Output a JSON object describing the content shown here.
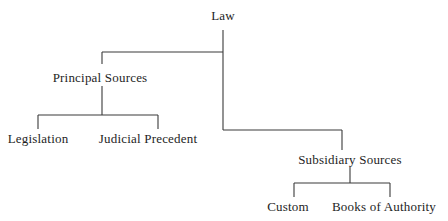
{
  "diagram": {
    "type": "tree",
    "root": {
      "label": "Law",
      "children": [
        {
          "label": "Principal Sources",
          "children": [
            {
              "label": "Legislation"
            },
            {
              "label": "Judicial Precedent"
            }
          ]
        },
        {
          "label": "Subsidiary Sources",
          "children": [
            {
              "label": "Custom"
            },
            {
              "label": "Books of Authority"
            }
          ]
        }
      ]
    }
  },
  "nodes": {
    "law": "Law",
    "principal": "Principal Sources",
    "legislation": "Legislation",
    "judicial": "Judicial Precedent",
    "subsidiary": "Subsidiary Sources",
    "custom": "Custom",
    "books": "Books of Authority"
  },
  "colors": {
    "line": "#3a3a3a",
    "text": "#1e1e1e",
    "background": "#ffffff"
  }
}
